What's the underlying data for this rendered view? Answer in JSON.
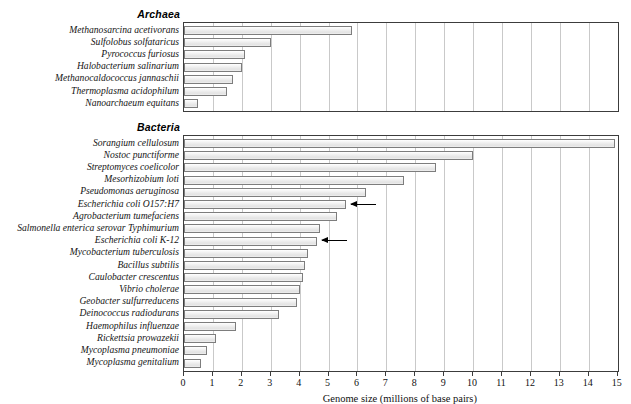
{
  "chart_data": {
    "type": "bar",
    "orientation": "horizontal",
    "title": "",
    "xlabel": "Genome size (millions of base pairs)",
    "ylabel": "",
    "xlim": [
      0,
      15
    ],
    "xticks": [
      "0",
      "1",
      "2",
      "3",
      "4",
      "5",
      "6",
      "7",
      "8",
      "9",
      "10",
      "11",
      "12",
      "13",
      "14",
      "15"
    ],
    "grid": "vertical",
    "legend": "none",
    "groups": [
      {
        "name": "Archaea",
        "categories": [
          "Methanosarcina acetivorans",
          "Sulfolobus solfataricus",
          "Pyrococcus furiosus",
          "Halobacterium salinarium",
          "Methanocaldococcus jannaschii",
          "Thermoplasma acidophilum",
          "Nanoarchaeum equitans"
        ],
        "values": [
          5.8,
          3.0,
          2.1,
          2.0,
          1.7,
          1.5,
          0.5
        ]
      },
      {
        "name": "Bacteria",
        "categories": [
          "Sorangium cellulosum",
          "Nostoc punctiforme",
          "Streptomyces coelicolor",
          "Mesorhizobium loti",
          "Pseudomonas aeruginosa",
          "Escherichia coli O157:H7",
          "Agrobacterium tumefaciens",
          "Salmonella enterica serovar Typhimurium",
          "Escherichia coli K-12",
          "Mycobacterium tuberculosis",
          "Bacillus subtilis",
          "Caulobacter crescentus",
          "Vibrio cholerae",
          "Geobacter sulfurreducens",
          "Deinococcus radiodurans",
          "Haemophilus influenzae",
          "Rickettsia prowazekii",
          "Mycoplasma pneumoniae",
          "Mycoplasma genitalium"
        ],
        "values": [
          14.9,
          10.0,
          8.7,
          7.6,
          6.3,
          5.6,
          5.3,
          4.7,
          4.6,
          4.3,
          4.2,
          4.1,
          4.0,
          3.9,
          3.3,
          1.8,
          1.1,
          0.8,
          0.6
        ]
      }
    ],
    "annotations": [
      {
        "target": "Escherichia coli O157:H7",
        "style": "left-pointing-arrow"
      },
      {
        "target": "Escherichia coli K-12",
        "style": "left-pointing-arrow"
      }
    ]
  },
  "colors": {
    "bar_fill": "#ecECec",
    "bar_stroke": "#7d7d7d",
    "gridline": "#c9c9c9",
    "axis": "#3c3c3c",
    "text": "#111111"
  }
}
